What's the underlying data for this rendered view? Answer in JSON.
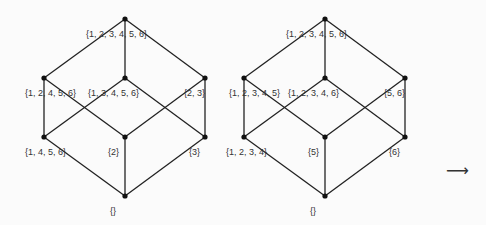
{
  "diagrams": [
    {
      "name": "left-lattice",
      "nodes": [
        {
          "id": "top",
          "x": 125,
          "y": 19,
          "label": "{1, 2, 3, 4, 5, 6}",
          "lx": 86,
          "ly": 29
        },
        {
          "id": "m1",
          "x": 44,
          "y": 78,
          "label": "{1, 2, 4, 5, 6}",
          "lx": 25,
          "ly": 88
        },
        {
          "id": "m2",
          "x": 125,
          "y": 78,
          "label": "{1, 3, 4, 5, 6}",
          "lx": 88,
          "ly": 88
        },
        {
          "id": "m3",
          "x": 205,
          "y": 78,
          "label": "{2, 3}",
          "lx": 184,
          "ly": 88
        },
        {
          "id": "l1",
          "x": 44,
          "y": 137,
          "label": "{1, 4, 5, 6}",
          "lx": 25,
          "ly": 147
        },
        {
          "id": "l2",
          "x": 125,
          "y": 137,
          "label": "{2}",
          "lx": 108,
          "ly": 147
        },
        {
          "id": "l3",
          "x": 205,
          "y": 137,
          "label": "{3}",
          "lx": 189,
          "ly": 147
        },
        {
          "id": "bot",
          "x": 125,
          "y": 196,
          "label": "{}",
          "lx": 110,
          "ly": 206
        }
      ]
    },
    {
      "name": "right-lattice",
      "nodes": [
        {
          "id": "top",
          "x": 325,
          "y": 19,
          "label": "{1, 2, 3, 4, 5, 6}",
          "lx": 286,
          "ly": 29
        },
        {
          "id": "m1",
          "x": 244,
          "y": 78,
          "label": "{1, 2, 3, 4, 5}",
          "lx": 229,
          "ly": 88
        },
        {
          "id": "m2",
          "x": 325,
          "y": 78,
          "label": "{1, 2, 3, 4, 6}",
          "lx": 288,
          "ly": 88
        },
        {
          "id": "m3",
          "x": 405,
          "y": 78,
          "label": "{5, 6}",
          "lx": 384,
          "ly": 88
        },
        {
          "id": "l1",
          "x": 244,
          "y": 137,
          "label": "{1, 2, 3, 4}",
          "lx": 226,
          "ly": 147
        },
        {
          "id": "l2",
          "x": 325,
          "y": 137,
          "label": "{5}",
          "lx": 308,
          "ly": 147
        },
        {
          "id": "l3",
          "x": 405,
          "y": 137,
          "label": "{6}",
          "lx": 389,
          "ly": 147
        },
        {
          "id": "bot",
          "x": 325,
          "y": 196,
          "label": "{}",
          "lx": 310,
          "ly": 206
        }
      ]
    }
  ],
  "edges": [
    [
      "top",
      "m1"
    ],
    [
      "top",
      "m2"
    ],
    [
      "top",
      "m3"
    ],
    [
      "m1",
      "l1"
    ],
    [
      "m1",
      "l2"
    ],
    [
      "m2",
      "l1"
    ],
    [
      "m2",
      "l3"
    ],
    [
      "m3",
      "l2"
    ],
    [
      "m3",
      "l3"
    ],
    [
      "l1",
      "bot"
    ],
    [
      "l2",
      "bot"
    ],
    [
      "l3",
      "bot"
    ]
  ],
  "arrow": {
    "glyph": "⟶",
    "x": 446,
    "y": 163
  },
  "colors": {
    "line": "#222222",
    "node": "#111111",
    "background": "#fbfbfb"
  }
}
